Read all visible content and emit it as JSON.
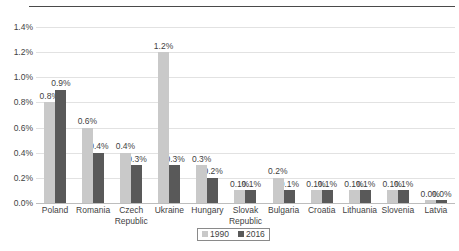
{
  "chart_data": {
    "type": "bar",
    "title": "",
    "subtitle": "",
    "xlabel": "",
    "ylabel": "",
    "ylim": [
      0,
      1.4
    ],
    "ytick_labels": [
      "1.4%",
      "1.2%",
      "1.0%",
      "0.8%",
      "0.6%",
      "0.4%",
      "0.2%",
      "0.0%"
    ],
    "ytick_values": [
      1.4,
      1.2,
      1.0,
      0.8,
      0.6,
      0.4,
      0.2,
      0.0
    ],
    "grid": "horizontal",
    "legend_position": "bottom-center",
    "categories": [
      "Poland",
      "Romania",
      "Czech\nRepublic",
      "Ukraine",
      "Hungary",
      "Slovak\nRepublic",
      "Bulgaria",
      "Croatia",
      "Lithuania",
      "Slovenia",
      "Latvia"
    ],
    "series": [
      {
        "name": "1990",
        "color": "#c9c9c9",
        "values": [
          0.8,
          0.6,
          0.4,
          1.2,
          0.3,
          0.1,
          0.2,
          0.1,
          0.1,
          0.1,
          0.0
        ],
        "labels": [
          "0.8%",
          "0.6%",
          "0.4%",
          "1.2%",
          "0.3%",
          "0.1%",
          "0.2%",
          "0.1%",
          "0.1%",
          "0.1%",
          "0.0%"
        ]
      },
      {
        "name": "2016",
        "color": "#595959",
        "values": [
          0.9,
          0.4,
          0.3,
          0.3,
          0.2,
          0.1,
          0.1,
          0.1,
          0.1,
          0.1,
          0.0
        ],
        "labels": [
          "0.9%",
          "0.4%",
          "0.3%",
          "0.3%",
          "0.2%",
          "0.1%",
          "0.1%",
          "0.1%",
          "0.1%",
          "0.1%",
          "0.0%"
        ]
      }
    ]
  },
  "legend": {
    "items": [
      {
        "label": "1990",
        "color": "#c9c9c9"
      },
      {
        "label": "2016",
        "color": "#595959"
      }
    ]
  }
}
